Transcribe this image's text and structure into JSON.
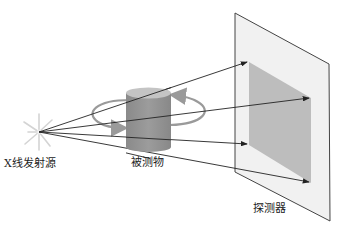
{
  "labels": {
    "source": "X线发射源",
    "object": "被测物",
    "detector": "探测器"
  },
  "colors": {
    "panel_fill": "#f1f1f1",
    "panel_stroke": "#444444",
    "shadow_fill": "#bdbdbd",
    "cylinder_body": "#8f8f8f",
    "cylinder_top": "#c4c4c4",
    "ray": "#222222",
    "rotation_arrow": "#9a9a9a",
    "source_glow": "#d0d0d0"
  }
}
